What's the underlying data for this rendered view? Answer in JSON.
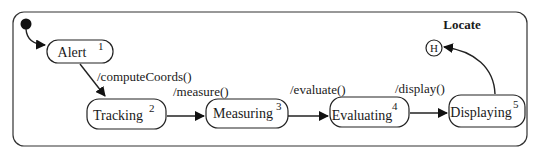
{
  "diagram": {
    "type": "uml-state-machine",
    "composite_state": {
      "title": "Locate"
    },
    "initial_pseudostate": {
      "kind": "initial"
    },
    "history_pseudostate": {
      "label": "H"
    },
    "states": [
      {
        "id": "alert",
        "label": "Alert",
        "number": "1"
      },
      {
        "id": "tracking",
        "label": "Tracking",
        "number": "2"
      },
      {
        "id": "measuring",
        "label": "Measuring",
        "number": "3"
      },
      {
        "id": "evaluating",
        "label": "Evaluating",
        "number": "4"
      },
      {
        "id": "displaying",
        "label": "Displaying",
        "number": "5"
      }
    ],
    "transitions": [
      {
        "from": "initial",
        "to": "alert",
        "label": ""
      },
      {
        "from": "alert",
        "to": "tracking",
        "label": "/computeCoords()"
      },
      {
        "from": "tracking",
        "to": "measuring",
        "label": "/measure()"
      },
      {
        "from": "measuring",
        "to": "evaluating",
        "label": "/evaluate()"
      },
      {
        "from": "evaluating",
        "to": "displaying",
        "label": "/display()"
      },
      {
        "from": "displaying",
        "to": "history",
        "label": ""
      }
    ]
  }
}
